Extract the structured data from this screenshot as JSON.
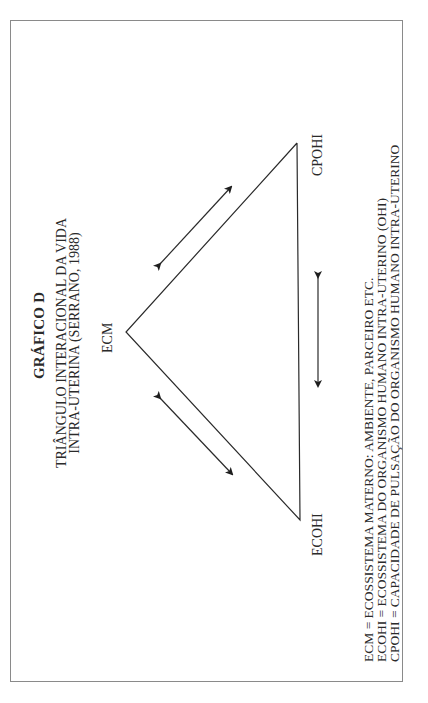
{
  "title": "GRÁFICO D",
  "subtitle": {
    "line1": "TRIÂNGULO INTERACIONAL DA VIDA",
    "line2": "INTRA-UTERINA (SERRANO, 1988)"
  },
  "vertices": {
    "apex": "ECM",
    "top": "CPOHI",
    "bottom": "ECOHI"
  },
  "edges": [
    {
      "from": "ECM",
      "to": "CPOHI",
      "arrow": "bidirectional"
    },
    {
      "from": "ECM",
      "to": "ECOHI",
      "arrow": "bidirectional"
    },
    {
      "from": "CPOHI",
      "to": "ECOHI",
      "arrow": "bidirectional"
    }
  ],
  "legend": [
    "ECM = ECOSSISTEMA MATERNO: AMBIENTE, PARCEIRO ETC.",
    "ECOHI = ECOSSISTEMA DO ORGANISMO HUMANO INTRA-UTERINO (OHI)",
    "CPOHI = CAPACIDADE DE PULSAÇÃO DO ORGANISMO HUMANO INTRA-UTERINO"
  ],
  "colors": {
    "ink": "#2a2a2a",
    "frame": "#8a8a8a",
    "background": "#ffffff"
  }
}
